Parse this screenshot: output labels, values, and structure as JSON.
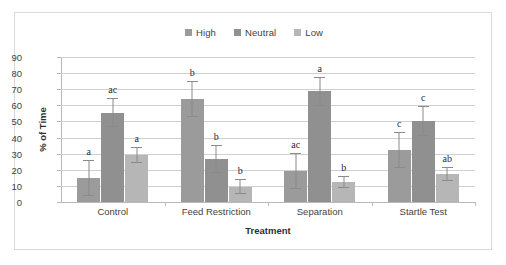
{
  "chart_data": {
    "type": "bar",
    "title": "",
    "xlabel": "Treatment",
    "ylabel": "% of Time",
    "ylim": [
      0,
      90
    ],
    "ytick_step": 10,
    "yticks": [
      90,
      80,
      70,
      60,
      50,
      40,
      30,
      20,
      10,
      0
    ],
    "grid": true,
    "legend_position": "top-center",
    "categories": [
      "Control",
      "Feed Restriction",
      "Separation",
      "Startle Test"
    ],
    "series": [
      {
        "name": "High",
        "color": "#9b9b9b",
        "values": [
          15.0,
          64.0,
          19.3,
          32.3
        ],
        "error_low": [
          11.0,
          11.3,
          11.0,
          11.3
        ],
        "error_high": [
          11.0,
          11.3,
          11.0,
          11.3
        ],
        "annotations": [
          "a",
          "b",
          "ac",
          "c"
        ]
      },
      {
        "name": "Neutral",
        "color": "#909090",
        "values": [
          55.4,
          26.7,
          68.6,
          50.1
        ],
        "error_low": [
          9.0,
          8.7,
          8.9,
          9.3
        ],
        "error_high": [
          9.0,
          8.7,
          8.9,
          9.3
        ],
        "annotations": [
          "ac",
          "b",
          "a",
          "c"
        ]
      },
      {
        "name": "Low",
        "color": "#b6b6b6",
        "values": [
          29.2,
          9.5,
          12.3,
          17.4
        ],
        "error_low": [
          4.8,
          4.8,
          3.7,
          4.2
        ],
        "error_high": [
          4.8,
          4.8,
          3.7,
          4.2
        ],
        "annotations": [
          "a",
          "b",
          "b",
          "ab"
        ]
      }
    ]
  },
  "legend": {
    "entries": [
      {
        "label": "High",
        "color": "#9b9b9b"
      },
      {
        "label": "Neutral",
        "color": "#909090"
      },
      {
        "label": "Low",
        "color": "#b6b6b6"
      }
    ]
  },
  "axes": {
    "y_title": "% of Time",
    "x_title": "Treatment",
    "y_ticks": [
      "90",
      "80",
      "70",
      "60",
      "50",
      "40",
      "30",
      "20",
      "10",
      "0"
    ],
    "x_ticks": [
      "Control",
      "Feed Restriction",
      "Separation",
      "Startle Test"
    ]
  }
}
